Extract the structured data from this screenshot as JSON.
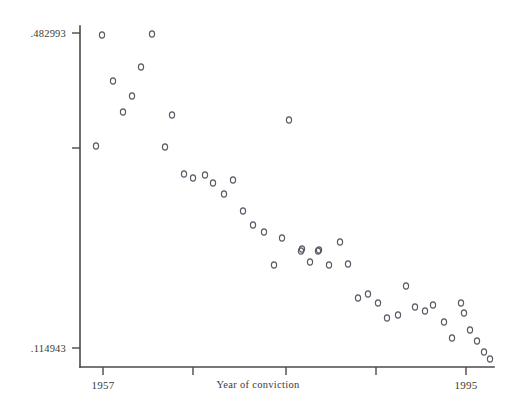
{
  "chart_data": {
    "type": "scatter",
    "title": "",
    "subtitle": "",
    "xlabel": "Year of conviction",
    "ylabel": "",
    "grid": false,
    "legend": null,
    "marker": {
      "shape": "open-circle",
      "size": 5,
      "color": "#5a5a66"
    },
    "xlim": [
      1956.0,
      1996.2
    ],
    "ylim": [
      0.103,
      0.505
    ],
    "xticks": [
      1957,
      1966,
      1976,
      1985,
      1995
    ],
    "xtick_labels": [
      "1957",
      "",
      "",
      "",
      "1995"
    ],
    "yticks": [
      0.482993,
      0.3,
      0.114943
    ],
    "ytick_labels": [
      ".482993",
      "",
      ".114943"
    ],
    "y_axis_top_label": ".482993",
    "y_axis_bottom_label": ".114943",
    "x_axis_left_label": "1957",
    "x_axis_right_label": "1995",
    "n_points": 46,
    "x": [
      1957.6,
      1959.0,
      1960.0,
      1961.0,
      1962.0,
      1962.6,
      1963.3,
      1964.0,
      1965.0,
      1966.0,
      1967.0,
      1968.0,
      1968.8,
      1969.6,
      1970.4,
      1971.0,
      1971.9,
      1972.7,
      1973.5,
      1974.3,
      1975.3,
      1976.2,
      1977.1,
      1978.0,
      1978.9,
      1979.5,
      1980.4,
      1981.2,
      1982.0,
      1982.8,
      1983.6,
      1984.5,
      1985.4,
      1986.2,
      1987.0,
      1987.9,
      1988.6,
      1989.4,
      1990.2,
      1990.9,
      1991.7,
      1992.3,
      1993.0,
      1993.8,
      1994.6,
      1995.3
    ],
    "y": [
      0.4814,
      0.4827,
      0.4476,
      0.4322,
      0.4159,
      0.3993,
      0.384,
      0.3016,
      0.3,
      0.3651,
      0.2689,
      0.2645,
      0.27,
      0.2598,
      0.248,
      0.2584,
      0.285,
      0.2326,
      0.218,
      0.205,
      0.1949,
      0.1888,
      0.179,
      0.1807,
      0.1692,
      0.182,
      0.183,
      0.1575,
      0.1662,
      0.1503,
      0.1469,
      0.1519,
      0.1474,
      0.1415,
      0.143,
      0.1565,
      0.1448,
      0.14,
      0.1448,
      0.1432,
      0.1404,
      0.133,
      0.1368,
      0.128,
      0.1208,
      0.1149
    ],
    "px": [
      102,
      113,
      123,
      132,
      141,
      152,
      165,
      172,
      96,
      184,
      193,
      205,
      213,
      224,
      233,
      243,
      253,
      264,
      274,
      282,
      289,
      301,
      302,
      310,
      318,
      319,
      329,
      340,
      348,
      358,
      368,
      378,
      387,
      398,
      406,
      415,
      425,
      433,
      444,
      452,
      461,
      464,
      470,
      477,
      484,
      490
    ],
    "py": [
      35,
      81,
      112,
      96,
      67,
      34,
      147,
      115,
      146,
      174,
      178,
      175,
      183,
      194,
      180,
      211,
      225,
      232,
      265,
      238,
      120,
      251,
      249,
      262,
      251,
      250,
      265,
      242,
      264,
      298,
      294,
      303,
      318,
      315,
      286,
      307,
      311,
      305,
      322,
      338,
      303,
      313,
      330,
      341,
      352,
      359
    ]
  },
  "axes": {
    "y_top_tick": ".482993",
    "y_bottom_tick": ".114943",
    "x_first_tick": "1957",
    "x_last_tick": "1995",
    "x_title": "Year of conviction"
  }
}
